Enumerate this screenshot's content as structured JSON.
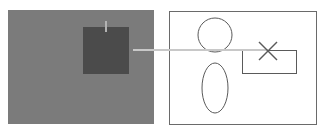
{
  "diagram": {
    "colors": {
      "background": "#ffffff",
      "left_panel_fill": "#7b7b7b",
      "dark_square_fill": "#4b4b4b",
      "connector_line": "#c8c8c8",
      "tick_mark": "#b2b2b2",
      "right_panel_fill": "#ffffff",
      "right_panel_stroke": "#6a6a6a",
      "shape_stroke": "#5a5a5a"
    },
    "left_panel": {
      "x": 8,
      "y": 10,
      "width": 146,
      "height": 114,
      "dark_square": {
        "x": 83,
        "y": 27,
        "width": 46,
        "height": 47
      },
      "tick_mark": {
        "x": 106,
        "y1": 21,
        "y2": 32
      }
    },
    "connector": {
      "x1": 133,
      "y1": 50,
      "x2": 268,
      "y2": 50
    },
    "right_panel": {
      "x": 169,
      "y": 11,
      "width": 147,
      "height": 113,
      "circle": {
        "cx": 215,
        "cy": 35,
        "r": 17
      },
      "ellipse": {
        "cx": 215,
        "cy": 88,
        "rx": 13,
        "ry": 25
      },
      "rectangle": {
        "x": 242,
        "y": 50,
        "width": 54,
        "height": 23
      },
      "x_mark": {
        "cx": 268,
        "cy": 51,
        "half": 9
      }
    }
  }
}
